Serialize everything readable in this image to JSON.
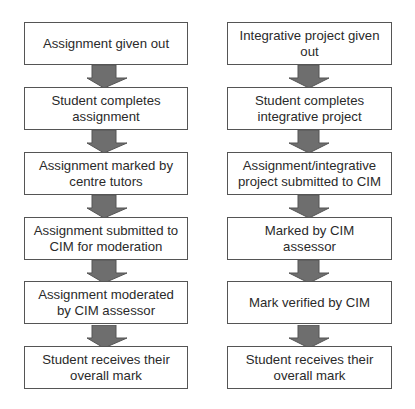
{
  "diagram": {
    "type": "flowchart",
    "colors": {
      "box_border": "#555555",
      "box_fill": "#ffffff",
      "text": "#2a2a2a",
      "arrow_fill": "#6e6e6e",
      "arrow_stroke": "#555555"
    },
    "left_flow": {
      "steps": [
        {
          "label": "Assignment given out"
        },
        {
          "label": "Student completes assignment"
        },
        {
          "label": "Assignment marked by centre tutors"
        },
        {
          "label": "Assignment submitted to CIM for moderation"
        },
        {
          "label": "Assignment moderated by CIM assessor"
        },
        {
          "label": "Student receives their overall mark"
        }
      ]
    },
    "right_flow": {
      "steps": [
        {
          "label": "Integrative project given out"
        },
        {
          "label": "Student completes integrative project"
        },
        {
          "label": "Assignment/integrative project submitted to CIM"
        },
        {
          "label": "Marked by CIM assessor"
        },
        {
          "label": "Mark verified by CIM"
        },
        {
          "label": "Student receives their overall mark"
        }
      ]
    },
    "arrow_icon": "down-arrow-icon"
  }
}
